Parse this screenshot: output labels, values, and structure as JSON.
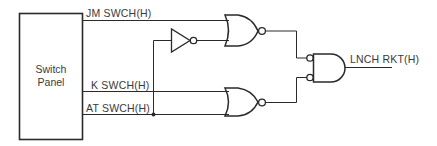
{
  "diagram": {
    "panel": {
      "line1": "Switch",
      "line2": "Panel"
    },
    "signals": {
      "jm": "JM SWCH(H)",
      "k": "K SWCH(H)",
      "at": "AT SWCH(H)",
      "output": "LNCH RKT(H)"
    },
    "gates": [
      {
        "type": "NOT",
        "id": "inverter"
      },
      {
        "type": "NOR",
        "id": "nor-top"
      },
      {
        "type": "NOR",
        "id": "nor-bottom"
      },
      {
        "type": "AND-with-inverted-inputs",
        "id": "and-output"
      }
    ],
    "colors": {
      "line": "#2a2a2a",
      "text": "#3a3a3a",
      "background": "#ffffff"
    }
  }
}
